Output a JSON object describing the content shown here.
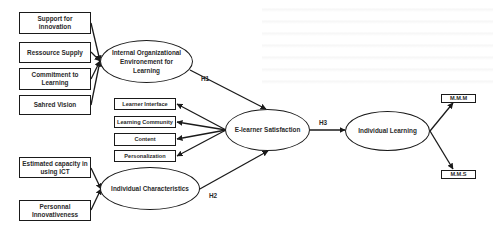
{
  "diagram": {
    "title": "",
    "nodes": {
      "support_innovation": "Support for innovation",
      "resource_supply": "Ressource Supply",
      "commitment_learning": "Commitment to Learning",
      "shared_vision": "Sahred Vision",
      "internal_org_env": "Internal Organizational Environement for Learning",
      "learner_interface": "Learner Interface",
      "learning_community": "Learning Community",
      "content": "Content",
      "personalization": "Personalization",
      "estimated_capacity": "Estimated capacity in using ICT",
      "personal_innovativeness": "Personnal Innovativeness",
      "individual_characteristics": "Individual Characteristics",
      "elearner_satisfaction": "E-learner Satisfaction",
      "individual_learning": "Individual Learning",
      "mmm": "M.M.M",
      "mms": "M.M.S"
    },
    "edge_labels": {
      "h1": "H1",
      "h2": "H2",
      "h3": "H3"
    },
    "edges": [
      {
        "from": "Support for innovation",
        "to": "Internal Organizational Environement for Learning"
      },
      {
        "from": "Ressource Supply",
        "to": "Internal Organizational Environement for Learning"
      },
      {
        "from": "Commitment to Learning",
        "to": "Internal Organizational Environement for Learning"
      },
      {
        "from": "Sahred Vision",
        "to": "Internal Organizational Environement for Learning"
      },
      {
        "from": "Internal Organizational Environement for Learning",
        "to": "E-learner Satisfaction",
        "label": "H1"
      },
      {
        "from": "E-learner Satisfaction",
        "to": "Learner Interface"
      },
      {
        "from": "E-learner Satisfaction",
        "to": "Learning Community"
      },
      {
        "from": "E-learner Satisfaction",
        "to": "Content"
      },
      {
        "from": "E-learner Satisfaction",
        "to": "Personalization"
      },
      {
        "from": "Estimated capacity in using ICT",
        "to": "Individual Characteristics"
      },
      {
        "from": "Personnal Innovativeness",
        "to": "Individual Characteristics"
      },
      {
        "from": "Individual Characteristics",
        "to": "E-learner Satisfaction",
        "label": "H2"
      },
      {
        "from": "E-learner Satisfaction",
        "to": "Individual Learning",
        "label": "H3"
      },
      {
        "from": "Individual Learning",
        "to": "M.M.M"
      },
      {
        "from": "Individual Learning",
        "to": "M.M.S"
      }
    ],
    "colors": {
      "stroke": "#1a1a1a",
      "text": "#2a2a2a",
      "background": "#ffffff"
    }
  }
}
